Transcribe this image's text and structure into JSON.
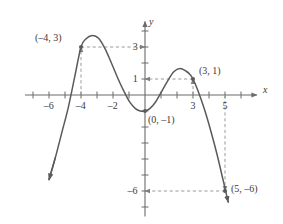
{
  "chart_data": {
    "type": "line",
    "title": "",
    "xlabel": "x",
    "ylabel": "y",
    "xlim": [
      -7.5,
      7.0
    ],
    "ylim": [
      -7.6,
      4.6
    ],
    "grid": false,
    "legend": null,
    "x_ticks": [
      -7,
      -6,
      -5,
      -4,
      -3,
      -2,
      -1,
      1,
      2,
      3,
      4,
      5,
      6
    ],
    "y_ticks": [
      -7,
      -6,
      -5,
      -4,
      -3,
      -2,
      -1,
      1,
      2,
      3,
      4
    ],
    "x_tick_labels": [
      {
        "value": -6,
        "text": "–6"
      },
      {
        "value": -4,
        "text": "–4"
      },
      {
        "value": -2,
        "text": "–2"
      },
      {
        "value": 3,
        "text": "3"
      },
      {
        "value": 5,
        "text": "5"
      }
    ],
    "y_tick_labels": [
      {
        "value": 3,
        "text": "3"
      },
      {
        "value": 1,
        "text": "1"
      },
      {
        "value": -6,
        "text": "–6"
      }
    ],
    "series": [
      {
        "name": "curve",
        "color": "#5a5a5a",
        "arrow_start": true,
        "arrow_end": true,
        "points": [
          [
            -6.0,
            -5.3
          ],
          [
            -5.6,
            -3.9
          ],
          [
            -5.2,
            -2.35
          ],
          [
            -4.8,
            -0.8
          ],
          [
            -4.4,
            1.1
          ],
          [
            -4.0,
            3.0
          ],
          [
            -3.7,
            3.5
          ],
          [
            -3.3,
            3.72
          ],
          [
            -2.9,
            3.55
          ],
          [
            -2.5,
            2.9
          ],
          [
            -2.1,
            2.0
          ],
          [
            -1.7,
            1.05
          ],
          [
            -1.3,
            0.2
          ],
          [
            -0.95,
            -0.45
          ],
          [
            -0.6,
            -0.85
          ],
          [
            -0.3,
            -1.0
          ],
          [
            0.0,
            -1.0
          ],
          [
            0.3,
            -0.85
          ],
          [
            0.65,
            -0.45
          ],
          [
            1.0,
            0.15
          ],
          [
            1.4,
            0.85
          ],
          [
            1.8,
            1.45
          ],
          [
            2.2,
            1.65
          ],
          [
            2.55,
            1.5
          ],
          [
            2.8,
            1.3
          ],
          [
            3.0,
            1.0
          ],
          [
            3.3,
            0.3
          ],
          [
            3.7,
            -0.85
          ],
          [
            4.1,
            -2.2
          ],
          [
            4.5,
            -3.7
          ],
          [
            4.9,
            -5.4
          ],
          [
            5.2,
            -6.7
          ]
        ]
      }
    ],
    "labeled_points": [
      {
        "id": "pt-a",
        "x": -4,
        "y": 3,
        "label": "(–4, 3)",
        "label_side": "left"
      },
      {
        "id": "pt-b",
        "x": 3,
        "y": 1,
        "label": "(3, 1)",
        "label_side": "right"
      },
      {
        "id": "pt-c",
        "x": 0,
        "y": -1,
        "label": "(0, –1)",
        "label_side": "right"
      },
      {
        "id": "pt-d",
        "x": 5,
        "y": -6,
        "label": "(5, –6)",
        "label_side": "right"
      }
    ],
    "guide_lines": [
      {
        "id": "guide-a-horizontal",
        "from": [
          -4,
          3
        ],
        "to": [
          0,
          3
        ],
        "style": "dashed",
        "arrow": "end"
      },
      {
        "id": "guide-a-vertical",
        "from": [
          -4,
          0
        ],
        "to": [
          -4,
          3
        ],
        "style": "dashed",
        "arrow": "end"
      },
      {
        "id": "guide-b-horizontal",
        "from": [
          3,
          1
        ],
        "to": [
          0,
          1
        ],
        "style": "dashed",
        "arrow": "end"
      },
      {
        "id": "guide-b-vertical",
        "from": [
          3,
          0
        ],
        "to": [
          3,
          1
        ],
        "style": "dashed",
        "arrow": "end"
      },
      {
        "id": "guide-d-vertical",
        "from": [
          5,
          0
        ],
        "to": [
          5,
          -6
        ],
        "style": "dashed",
        "arrow": "end"
      },
      {
        "id": "guide-d-horizontal",
        "from": [
          5,
          -6
        ],
        "to": [
          0,
          -6
        ],
        "style": "dashed",
        "arrow": "end"
      }
    ],
    "colors": {
      "curve": "#5a5a5a",
      "axis": "#6b6b6b",
      "guide": "#9a9a9a",
      "text": "#3a3a3a",
      "background": "#ffffff"
    }
  }
}
